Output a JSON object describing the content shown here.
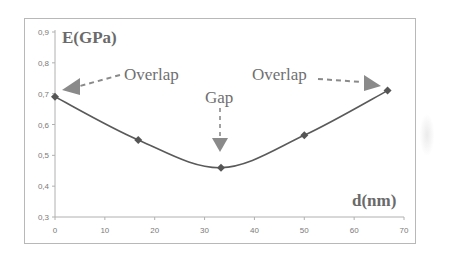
{
  "chart_data": {
    "type": "line",
    "title": "",
    "xlabel": "d(nm)",
    "ylabel": "E(GPa)",
    "x": [
      0,
      16.7,
      33.3,
      50,
      66.7
    ],
    "series": [
      {
        "name": "E",
        "values": [
          0.69,
          0.55,
          0.46,
          0.565,
          0.71
        ]
      }
    ],
    "xlim": [
      0,
      70
    ],
    "ylim": [
      0.3,
      0.9
    ],
    "x_ticks": [
      "0",
      "10",
      "20",
      "30",
      "40",
      "50",
      "60",
      "70"
    ],
    "y_ticks": [
      "0,3",
      "0,4",
      "0,5",
      "0,6",
      "0,7",
      "0,8",
      "0,9"
    ],
    "grid": false,
    "legend": null,
    "smoothed": true,
    "marker": "diamond",
    "annotations": [
      {
        "text": "Overlap",
        "arrow_to": "left-point"
      },
      {
        "text": "Gap",
        "arrow_to": "min-point"
      },
      {
        "text": "Overlap",
        "arrow_to": "right-point"
      }
    ]
  },
  "labels": {
    "y_axis_title": "E(GPa)",
    "x_axis_title": "d(nm)",
    "annotation_left": "Overlap",
    "annotation_center": "Gap",
    "annotation_right": "Overlap"
  },
  "colors": {
    "line": "#5a5a5a",
    "marker": "#555555",
    "arrow": "#8a8a8a",
    "axis": "#b0b0b0"
  }
}
